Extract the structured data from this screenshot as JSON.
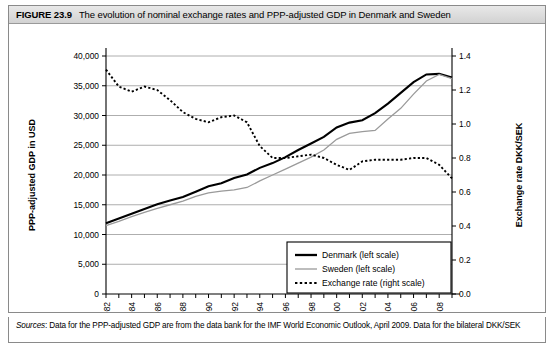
{
  "figure": {
    "number": "FIGURE 23.9",
    "title": "The evolution of nominal exchange rates and PPP-adjusted GDP in Denmark and Sweden",
    "sources_label": "Sources",
    "sources_text": ": Data for the PPP-adjusted GDP are from the data bank for the IMF World Economic Outlook, April 2009. Data for the bilateral DKK/SEK"
  },
  "chart_data": {
    "type": "line",
    "title": "The evolution of nominal exchange rates and PPP-adjusted GDP in Denmark and Sweden",
    "xlabel": "",
    "ylabel": "PPP-adjusted GDP in USD",
    "y2label": "Exchange rate DKK/SEK",
    "xlim": [
      1982,
      2009
    ],
    "ylim": [
      0,
      40000
    ],
    "y2lim": [
      0.0,
      1.4
    ],
    "grid": true,
    "legend_position": "lower right",
    "x": [
      1982,
      1983,
      1984,
      1985,
      1986,
      1987,
      1988,
      1989,
      1990,
      1991,
      1992,
      1993,
      1994,
      1995,
      1996,
      1997,
      1998,
      1999,
      2000,
      2001,
      2002,
      2003,
      2004,
      2005,
      2006,
      2007,
      2008,
      2009
    ],
    "xticks": [
      1982,
      1984,
      1986,
      1988,
      1990,
      1992,
      1994,
      1996,
      1998,
      2000,
      2002,
      2004,
      2006,
      2008
    ],
    "xtick_labels": [
      "1982",
      "1984",
      "1986",
      "1988",
      "1990",
      "1992",
      "1994",
      "1996",
      "1998",
      "2000",
      "2002",
      "2004",
      "2006",
      "2008"
    ],
    "yticks": [
      0,
      5000,
      10000,
      15000,
      20000,
      25000,
      30000,
      35000,
      40000
    ],
    "ytick_labels": [
      "0",
      "5,000",
      "10,000",
      "15,000",
      "20,000",
      "25,000",
      "30,000",
      "35,000",
      "40,000"
    ],
    "y2ticks": [
      0.0,
      0.2,
      0.4,
      0.6,
      0.8,
      1.0,
      1.2,
      1.4
    ],
    "y2tick_labels": [
      "0.0",
      "0.2",
      "0.4",
      "0.6",
      "0.8",
      "1.0",
      "1.2",
      "1.4"
    ],
    "series": [
      {
        "name": "Denmark (left scale)",
        "axis": "left",
        "style": "solid-thick",
        "color": "#000000",
        "values": [
          11900,
          12700,
          13500,
          14300,
          15100,
          15700,
          16300,
          17200,
          18100,
          18600,
          19500,
          20100,
          21200,
          22000,
          23000,
          24200,
          25300,
          26400,
          28000,
          28800,
          29200,
          30400,
          32000,
          33800,
          35600,
          36900,
          37000,
          36400
        ]
      },
      {
        "name": "Sweden (left scale)",
        "axis": "left",
        "style": "solid-thin",
        "color": "#9a9a9a",
        "values": [
          11500,
          12200,
          13000,
          13700,
          14400,
          15000,
          15600,
          16400,
          17000,
          17300,
          17500,
          17900,
          19000,
          20000,
          21000,
          22000,
          23000,
          24200,
          26000,
          27000,
          27300,
          27500,
          29400,
          31200,
          33600,
          35800,
          36900,
          36200
        ]
      },
      {
        "name": "Exchange rate (right scale)",
        "axis": "right",
        "style": "dotted",
        "color": "#000000",
        "values": [
          1.32,
          1.22,
          1.19,
          1.22,
          1.2,
          1.14,
          1.07,
          1.03,
          1.01,
          1.04,
          1.05,
          1.01,
          0.87,
          0.8,
          0.8,
          0.81,
          0.82,
          0.8,
          0.76,
          0.73,
          0.78,
          0.79,
          0.79,
          0.79,
          0.8,
          0.8,
          0.76,
          0.68
        ]
      }
    ]
  },
  "legend": {
    "items": [
      {
        "label": "Denmark (left scale)"
      },
      {
        "label": "Sweden (left scale)"
      },
      {
        "label": "Exchange rate (right scale)"
      }
    ]
  }
}
